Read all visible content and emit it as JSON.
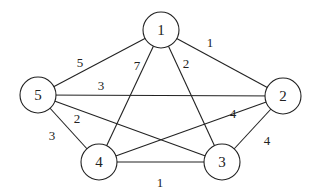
{
  "graph": {
    "node_radius": 18,
    "nodes": [
      {
        "id": "1",
        "label": "1",
        "x": 161,
        "y": 30
      },
      {
        "id": "2",
        "label": "2",
        "x": 283,
        "y": 96
      },
      {
        "id": "3",
        "label": "3",
        "x": 222,
        "y": 162
      },
      {
        "id": "4",
        "label": "4",
        "x": 99,
        "y": 162
      },
      {
        "id": "5",
        "label": "5",
        "x": 38,
        "y": 95
      }
    ],
    "edges": [
      {
        "from": "1",
        "to": "2",
        "weight": "1",
        "lx": 210,
        "ly": 42
      },
      {
        "from": "1",
        "to": "3",
        "weight": "2",
        "lx": 186,
        "ly": 63
      },
      {
        "from": "1",
        "to": "4",
        "weight": "7",
        "lx": 137,
        "ly": 65
      },
      {
        "from": "1",
        "to": "5",
        "weight": "5",
        "lx": 80,
        "ly": 62
      },
      {
        "from": "5",
        "to": "2",
        "weight": "3",
        "lx": 101,
        "ly": 85
      },
      {
        "from": "5",
        "to": "3",
        "weight": "2",
        "lx": 77,
        "ly": 118
      },
      {
        "from": "5",
        "to": "4",
        "weight": "3",
        "lx": 52,
        "ly": 135
      },
      {
        "from": "4",
        "to": "2",
        "weight": "4",
        "lx": 233,
        "ly": 113
      },
      {
        "from": "2",
        "to": "3",
        "weight": "4",
        "lx": 267,
        "ly": 140
      },
      {
        "from": "4",
        "to": "3",
        "weight": "1",
        "lx": 160,
        "ly": 182
      }
    ]
  }
}
